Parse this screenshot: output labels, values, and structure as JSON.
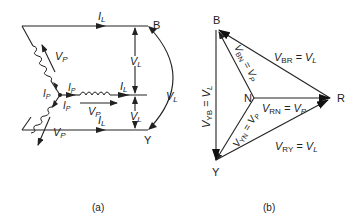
{
  "figure_a": {
    "caption": "(a)",
    "node_B": "B",
    "node_Y": "Y",
    "line_current_top": "I",
    "line_current_top_sub": "L",
    "line_current_mid": "I",
    "line_current_mid_sub": "L",
    "line_current_bottom": "I",
    "line_current_bottom_sub": "L",
    "phase_current_1": "I",
    "phase_current_1_sub": "P",
    "phase_current_2": "I",
    "phase_current_2_sub": "P",
    "phase_current_3": "I",
    "phase_current_3_sub": "P",
    "phase_voltage_upper": "V",
    "phase_voltage_upper_sub": "P",
    "phase_voltage_mid": "V",
    "phase_voltage_mid_sub": "P",
    "phase_voltage_lower": "V",
    "phase_voltage_lower_sub": "P",
    "line_voltage_upper": "V",
    "line_voltage_upper_sub": "L",
    "line_voltage_lower": "V",
    "line_voltage_lower_sub": "L",
    "line_voltage_arc": "V",
    "line_voltage_arc_sub": "L"
  },
  "figure_b": {
    "caption": "(b)",
    "node_B": "B",
    "node_N": "N",
    "node_R": "R",
    "node_Y": "Y",
    "v_br": "V",
    "v_br_sub": "BR",
    "v_br_eq": " = V",
    "v_br_eq_sub": "L",
    "v_bn": "V",
    "v_bn_sub": "BN",
    "v_bn_eq": " = V",
    "v_bn_eq_sub": "P",
    "v_rn": "V",
    "v_rn_sub": "RN",
    "v_rn_eq": " = V",
    "v_rn_eq_sub": "P",
    "v_yn": "V",
    "v_yn_sub": "YN",
    "v_yn_eq": " = V",
    "v_yn_eq_sub": "P",
    "v_yb": "V",
    "v_yb_sub": "YB",
    "v_yb_eq": " = V",
    "v_yb_eq_sub": "L",
    "v_ry": "V",
    "v_ry_sub": "RY",
    "v_ry_eq": " = V",
    "v_ry_eq_sub": "L"
  }
}
